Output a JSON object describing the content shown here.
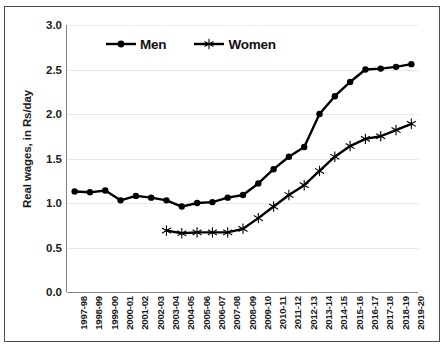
{
  "chart_data": {
    "type": "line",
    "title": "",
    "xlabel": "",
    "ylabel": "Real wages, in Rs/day",
    "ylim": [
      0.0,
      3.0
    ],
    "ytick_labels": [
      "0.0",
      "0.5",
      "1.0",
      "1.5",
      "2.0",
      "2.5",
      "3.0"
    ],
    "ytick_values": [
      0.0,
      0.5,
      1.0,
      1.5,
      2.0,
      2.5,
      3.0
    ],
    "grid": true,
    "legend_position": "top-center-inside",
    "categories": [
      "1997-98",
      "1998-99",
      "1999-00",
      "2000-01",
      "2001-02",
      "2002-03",
      "2003-04",
      "2004-05",
      "2005-06",
      "2006-07",
      "2007-08",
      "2008-09",
      "2009-10",
      "2010-11",
      "2011-12",
      "2012-13",
      "2013-14",
      "2014-15",
      "2015-16",
      "2016-17",
      "2017-18",
      "2018-19",
      "2019-20"
    ],
    "series": [
      {
        "name": "Men",
        "marker": "filled-circle",
        "color": "#000000",
        "values": [
          1.13,
          1.12,
          1.14,
          1.03,
          1.08,
          1.06,
          1.03,
          0.96,
          1.0,
          1.01,
          1.06,
          1.09,
          1.22,
          1.38,
          1.52,
          1.63,
          2.0,
          2.2,
          2.36,
          2.5,
          2.51,
          2.53,
          2.56
        ]
      },
      {
        "name": "Women",
        "marker": "asterisk",
        "color": "#000000",
        "values": [
          null,
          null,
          null,
          null,
          null,
          null,
          0.69,
          0.66,
          0.67,
          0.67,
          0.67,
          0.71,
          0.83,
          0.96,
          1.09,
          1.2,
          1.36,
          1.52,
          1.64,
          1.72,
          1.75,
          1.82,
          1.89
        ]
      }
    ]
  },
  "legend": {
    "entries": [
      {
        "label": "Men",
        "marker": "filled-circle"
      },
      {
        "label": "Women",
        "marker": "asterisk"
      }
    ]
  }
}
